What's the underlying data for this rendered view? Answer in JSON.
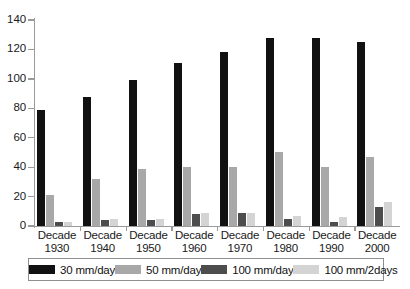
{
  "chart_data": {
    "type": "bar",
    "title": "",
    "subtitle": "",
    "xlabel": "",
    "ylabel": "",
    "ylim": [
      0,
      140
    ],
    "yticks": [
      0,
      20,
      40,
      60,
      80,
      100,
      120,
      140
    ],
    "grid": false,
    "legend_position": "bottom",
    "categories": [
      "Decade 1930",
      "Decade 1940",
      "Decade 1950",
      "Decade 1960",
      "Decade 1970",
      "Decade 1980",
      "Decade 1990",
      "Decade 2000"
    ],
    "category_lines": [
      [
        "Decade",
        "1930"
      ],
      [
        "Decade",
        "1940"
      ],
      [
        "Decade",
        "1950"
      ],
      [
        "Decade",
        "1960"
      ],
      [
        "Decade",
        "1970"
      ],
      [
        "Decade",
        "1980"
      ],
      [
        "Decade",
        "1990"
      ],
      [
        "Decade",
        "2000"
      ]
    ],
    "series": [
      {
        "name": "30 mm/day",
        "color": "#111111",
        "values": [
          79,
          88,
          99,
          111,
          118,
          128,
          128,
          125
        ]
      },
      {
        "name": "50 mm/day",
        "color": "#a8a8a8",
        "values": [
          21,
          32,
          39,
          40,
          40,
          50,
          40,
          47
        ]
      },
      {
        "name": "100 mm/day",
        "color": "#4d4d4d",
        "values": [
          3,
          4,
          4,
          8,
          9,
          5,
          3,
          13
        ]
      },
      {
        "name": "100 mm/2days",
        "color": "#d4d4d4",
        "values": [
          3,
          5,
          5,
          9,
          9,
          7,
          6,
          16
        ]
      }
    ]
  },
  "legend": {
    "items": [
      {
        "label": "30 mm/day",
        "color": "#111111"
      },
      {
        "label": "50 mm/day",
        "color": "#a8a8a8"
      },
      {
        "label": "100 mm/day",
        "color": "#4d4d4d"
      },
      {
        "label": "100 mm/2days",
        "color": "#d4d4d4"
      }
    ]
  },
  "axis": {
    "y_tick_labels": [
      "0",
      "20",
      "40",
      "60",
      "80",
      "100",
      "120",
      "140"
    ]
  }
}
